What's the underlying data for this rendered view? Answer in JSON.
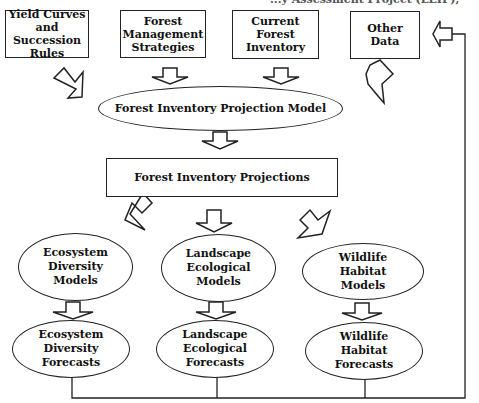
{
  "caption_fragment": "...y Assessment Project (LEIP),",
  "inputs": [
    {
      "id": "yield",
      "label": "Yield Curves\nand\nSuccession Rules"
    },
    {
      "id": "strategies",
      "label": "Forest\nManagement\nStrategies"
    },
    {
      "id": "inventory",
      "label": "Current\nForest\nInventory"
    },
    {
      "id": "other",
      "label": "Other\nData"
    }
  ],
  "projection_model": {
    "label": "Forest Inventory Projection Model"
  },
  "projections": {
    "label": "Forest Inventory Projections"
  },
  "models": [
    {
      "id": "ecosystem-models",
      "label": "Ecosystem\nDiversity\nModels"
    },
    {
      "id": "landscape-models",
      "label": "Landscape\nEcological\nModels"
    },
    {
      "id": "wildlife-models",
      "label": "Wildlife\nHabitat\nModels"
    }
  ],
  "forecasts": [
    {
      "id": "ecosystem-forecasts",
      "label": "Ecosystem\nDiversity\nForecasts"
    },
    {
      "id": "landscape-forecasts",
      "label": "Landscape\nEcological\nForecasts"
    },
    {
      "id": "wildlife-forecasts",
      "label": "Wildlife\nHabitat\nForecasts"
    }
  ],
  "colors": {
    "stroke": "#222222",
    "background": "#ffffff"
  }
}
